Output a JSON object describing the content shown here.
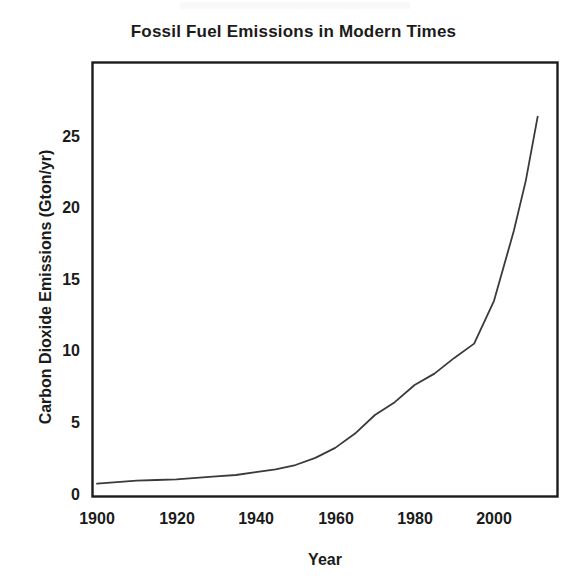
{
  "figure": {
    "title": "Fossil Fuel Emissions in Modern Times",
    "background_color": "#ffffff",
    "frame_color": "#1b1b1b",
    "line_color": "#3a3a3a"
  },
  "axes": {
    "x_label": "Year",
    "y_label": "Carbon Dioxide Emissions (Gton/yr)",
    "x_ticks": [
      "1900",
      "1920",
      "1940",
      "1960",
      "1980",
      "2000"
    ],
    "y_ticks": [
      "0",
      "5",
      "10",
      "15",
      "20",
      "25"
    ]
  },
  "chart_data": {
    "type": "line",
    "title": "Fossil Fuel Emissions in Modern Times",
    "xlabel": "Year",
    "ylabel": "Carbon Dioxide Emissions (Gton/yr)",
    "xlim": [
      1900,
      2017
    ],
    "ylim": [
      0,
      27.5
    ],
    "xticks": [
      1900,
      1920,
      1940,
      1960,
      1980,
      2000
    ],
    "yticks": [
      0,
      5,
      10,
      15,
      20,
      25
    ],
    "grid": false,
    "legend": false,
    "series": [
      {
        "name": "Carbon Dioxide Emissions",
        "x": [
          1900,
          1905,
          1910,
          1915,
          1920,
          1925,
          1930,
          1935,
          1940,
          1945,
          1950,
          1955,
          1960,
          1965,
          1970,
          1975,
          1980,
          1985,
          1990,
          1995,
          2000,
          2005,
          2008,
          2011
        ],
        "y": [
          0.8,
          0.9,
          1.0,
          1.05,
          1.1,
          1.2,
          1.3,
          1.4,
          1.6,
          1.8,
          2.1,
          2.6,
          3.3,
          4.3,
          5.6,
          6.5,
          7.7,
          8.5,
          9.6,
          10.6,
          13.6,
          18.5,
          22.0,
          26.5
        ]
      }
    ]
  }
}
